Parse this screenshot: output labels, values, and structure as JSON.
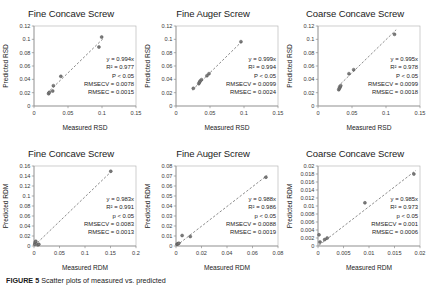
{
  "figure": {
    "caption_label": "FIGURE 5",
    "caption_text": "Scatter plots of measured vs. predicted"
  },
  "axis_titles": {
    "rsd_x": "Measured RSD",
    "rsd_y": "Predicted RSD",
    "rdm_x": "Measured RDM",
    "rdm_y": "Predicted RDM"
  },
  "chart_data": [
    {
      "id": "fine-concave-screw-rsd",
      "type": "scatter",
      "title": "Fine Concave Screw",
      "xlabel": "Measured RSD",
      "ylabel": "Predicted RSD",
      "xlim": [
        0,
        0.15
      ],
      "ylim": [
        0,
        0.12
      ],
      "xticks": [
        "0",
        "0.05",
        "0.1",
        "0.15"
      ],
      "xtick_values": [
        0,
        0.05,
        0.1,
        0.15
      ],
      "yticks": [
        "0",
        "0.02",
        "0.04",
        "0.06",
        "0.08",
        "0.1",
        "0.12"
      ],
      "ytick_values": [
        0,
        0.02,
        0.04,
        0.06,
        0.08,
        0.1,
        0.12
      ],
      "grid": false,
      "legend": "none",
      "points": [
        {
          "x": 0.0215,
          "y": 0.0185
        },
        {
          "x": 0.0225,
          "y": 0.0205
        },
        {
          "x": 0.0275,
          "y": 0.0225
        },
        {
          "x": 0.0285,
          "y": 0.0305
        },
        {
          "x": 0.0395,
          "y": 0.0445
        },
        {
          "x": 0.0955,
          "y": 0.0885
        },
        {
          "x": 0.0995,
          "y": 0.1035
        }
      ],
      "trendline": {
        "slope": 0.994,
        "intercept": 0,
        "x_start": 0.019,
        "x_end": 0.102
      },
      "annotations": [
        "y = 0.994x",
        "R² = 0.977",
        "P < 0.05",
        "RMSECV = 0.0078",
        "RMSEC = 0.0015"
      ]
    },
    {
      "id": "fine-auger-screw-rsd",
      "type": "scatter",
      "title": "Fine Auger Screw",
      "xlabel": "Measured RSD",
      "ylabel": "Predicted RSD",
      "xlim": [
        0,
        0.15
      ],
      "ylim": [
        0,
        0.12
      ],
      "xticks": [
        "0",
        "0.05",
        "0.1",
        "0.15"
      ],
      "xtick_values": [
        0,
        0.05,
        0.1,
        0.15
      ],
      "yticks": [
        "0",
        "0.02",
        "0.04",
        "0.06",
        "0.08",
        "0.1",
        "0.12"
      ],
      "ytick_values": [
        0,
        0.02,
        0.04,
        0.06,
        0.08,
        0.1,
        0.12
      ],
      "grid": false,
      "legend": "none",
      "points": [
        {
          "x": 0.0255,
          "y": 0.0265
        },
        {
          "x": 0.0335,
          "y": 0.0335
        },
        {
          "x": 0.0345,
          "y": 0.0355
        },
        {
          "x": 0.0355,
          "y": 0.0375
        },
        {
          "x": 0.0375,
          "y": 0.0395
        },
        {
          "x": 0.0455,
          "y": 0.0455
        },
        {
          "x": 0.0485,
          "y": 0.0485
        },
        {
          "x": 0.0955,
          "y": 0.0965
        }
      ],
      "trendline": {
        "slope": 0.999,
        "intercept": 0,
        "x_start": 0.024,
        "x_end": 0.098
      },
      "annotations": [
        "y = 0.999x",
        "R² = 0.994",
        "P < 0.05",
        "RMSECV = 0.0099",
        "RMSEC = 0.0024"
      ]
    },
    {
      "id": "coarse-concave-screw-rsd",
      "type": "scatter",
      "title": "Coarse Concave Screw",
      "xlabel": "Measured RSD",
      "ylabel": "Predicted RSD",
      "xlim": [
        0,
        0.15
      ],
      "ylim": [
        0,
        0.12
      ],
      "xticks": [
        "0",
        "0.05",
        "0.1",
        "0.15"
      ],
      "xtick_values": [
        0,
        0.05,
        0.1,
        0.15
      ],
      "yticks": [
        "0",
        "0.02",
        "0.04",
        "0.06",
        "0.08",
        "0.1",
        "0.12"
      ],
      "ytick_values": [
        0,
        0.02,
        0.04,
        0.06,
        0.08,
        0.1,
        0.12
      ],
      "grid": false,
      "legend": "none",
      "points": [
        {
          "x": 0.0305,
          "y": 0.0245
        },
        {
          "x": 0.0315,
          "y": 0.0265
        },
        {
          "x": 0.0325,
          "y": 0.0285
        },
        {
          "x": 0.0335,
          "y": 0.0305
        },
        {
          "x": 0.0455,
          "y": 0.0485
        },
        {
          "x": 0.0525,
          "y": 0.0545
        },
        {
          "x": 0.1125,
          "y": 0.1075
        }
      ],
      "trendline": {
        "slope": 0.995,
        "intercept": 0,
        "x_start": 0.029,
        "x_end": 0.115
      },
      "annotations": [
        "y = 0.995x",
        "R² = 0.978",
        "P < 0.05",
        "RMSECV = 0.0099",
        "RMSEC = 0.0018"
      ]
    },
    {
      "id": "fine-concave-screw-rdm",
      "type": "scatter",
      "title": "Fine Concave Screw",
      "xlabel": "Measured RDM",
      "ylabel": "Predicted RDM",
      "xlim": [
        0,
        0.2
      ],
      "ylim": [
        0,
        0.16
      ],
      "xticks": [
        "0",
        "0.05",
        "0.1",
        "0.15",
        "0.2"
      ],
      "xtick_values": [
        0,
        0.05,
        0.1,
        0.15,
        0.2
      ],
      "yticks": [
        "0",
        "0.02",
        "0.04",
        "0.06",
        "0.08",
        "0.1",
        "0.12",
        "0.14",
        "0.16"
      ],
      "ytick_values": [
        0,
        0.02,
        0.04,
        0.06,
        0.08,
        0.1,
        0.12,
        0.14,
        0.16
      ],
      "grid": false,
      "legend": "none",
      "points": [
        {
          "x": 0.0015,
          "y": 0.0035
        },
        {
          "x": 0.0025,
          "y": 0.0075
        },
        {
          "x": 0.0035,
          "y": 0.0095
        },
        {
          "x": 0.0075,
          "y": 0.0025
        },
        {
          "x": 0.0095,
          "y": 0.0035
        },
        {
          "x": 0.1505,
          "y": 0.1495
        }
      ],
      "trendline": {
        "slope": 0.983,
        "intercept": 0,
        "x_start": 0.001,
        "x_end": 0.153
      },
      "annotations": [
        "y = 0.983x",
        "R² = 0.991",
        "p < 0.05",
        "RMSECV = 0.0083",
        "RMSEC = 0.0013"
      ]
    },
    {
      "id": "fine-auger-screw-rdm",
      "type": "scatter",
      "title": "Fine Auger Screw",
      "xlabel": "Measured RDM",
      "ylabel": "Predicted RDM",
      "xlim": [
        0,
        0.08
      ],
      "ylim": [
        0,
        0.08
      ],
      "xticks": [
        "0",
        "0.02",
        "0.04",
        "0.06",
        "0.08"
      ],
      "xtick_values": [
        0,
        0.02,
        0.04,
        0.06,
        0.08
      ],
      "yticks": [
        "0",
        "0.01",
        "0.02",
        "0.03",
        "0.04",
        "0.05",
        "0.06",
        "0.07",
        "0.08"
      ],
      "ytick_values": [
        0,
        0.01,
        0.02,
        0.03,
        0.04,
        0.05,
        0.06,
        0.07,
        0.08
      ],
      "grid": false,
      "legend": "none",
      "points": [
        {
          "x": 0.0008,
          "y": 0.0018
        },
        {
          "x": 0.0015,
          "y": 0.0022
        },
        {
          "x": 0.0022,
          "y": 0.0028
        },
        {
          "x": 0.0048,
          "y": 0.0105
        },
        {
          "x": 0.0112,
          "y": 0.0095
        },
        {
          "x": 0.0705,
          "y": 0.0688
        }
      ],
      "trendline": {
        "slope": 0.988,
        "intercept": 0,
        "x_start": 0.0005,
        "x_end": 0.0715
      },
      "annotations": [
        "y = 0.988x",
        "R² = 0.986",
        "p < 0.05",
        "RMSECV = 0.0088",
        "RMSEC = 0.0019"
      ]
    },
    {
      "id": "coarse-concave-screw-rdm",
      "type": "scatter",
      "title": "Coarse Concave Screw",
      "xlabel": "Measured RDM",
      "ylabel": "Predicted RDM",
      "xlim": [
        0,
        0.02
      ],
      "ylim": [
        0,
        0.02
      ],
      "xticks": [
        "0",
        "0.005",
        "0.01",
        "0.015",
        "0.02"
      ],
      "xtick_values": [
        0,
        0.005,
        0.01,
        0.015,
        0.02
      ],
      "yticks": [
        "0",
        "0.002",
        "0.004",
        "0.006",
        "0.008",
        "0.01",
        "0.012",
        "0.014",
        "0.016",
        "0.018",
        "0.02"
      ],
      "ytick_values": [
        0,
        0.002,
        0.004,
        0.006,
        0.008,
        0.01,
        0.012,
        0.014,
        0.016,
        0.018,
        0.02
      ],
      "grid": false,
      "legend": "none",
      "points": [
        {
          "x": 0.0002,
          "y": 0.0028
        },
        {
          "x": 0.0004,
          "y": 0.001
        },
        {
          "x": 0.0013,
          "y": 0.0016
        },
        {
          "x": 0.0018,
          "y": 0.002
        },
        {
          "x": 0.0092,
          "y": 0.0108
        },
        {
          "x": 0.0188,
          "y": 0.018
        }
      ],
      "trendline": {
        "slope": 0.985,
        "intercept": 0,
        "x_start": 0.0002,
        "x_end": 0.0192
      },
      "annotations": [
        "y = 0.985x",
        "R² = 0.973",
        "p < 0.05",
        "RMSECV = 0.001",
        "RMSEC = 0.0006"
      ]
    }
  ]
}
